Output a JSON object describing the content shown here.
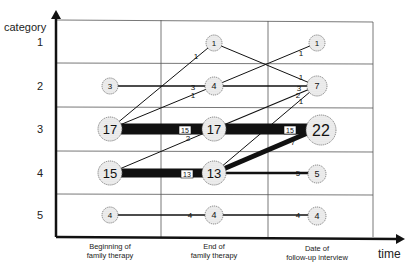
{
  "diagram": {
    "y_axis_label": "category",
    "x_axis_label": "time",
    "categories": [
      "1",
      "2",
      "3",
      "4",
      "5"
    ],
    "time_points": [
      {
        "label_line1": "Beginning of",
        "label_line2": "family therapy"
      },
      {
        "label_line1": "End of",
        "label_line2": "family therapy"
      },
      {
        "label_line1": "Date of",
        "label_line2": "follow-up interview"
      }
    ],
    "nodes": [
      {
        "time": 0,
        "category": 2,
        "count": 3
      },
      {
        "time": 0,
        "category": 3,
        "count": 17
      },
      {
        "time": 0,
        "category": 4,
        "count": 15
      },
      {
        "time": 0,
        "category": 5,
        "count": 4
      },
      {
        "time": 1,
        "category": 1,
        "count": 1
      },
      {
        "time": 1,
        "category": 2,
        "count": 4
      },
      {
        "time": 1,
        "category": 3,
        "count": 17
      },
      {
        "time": 1,
        "category": 4,
        "count": 13
      },
      {
        "time": 1,
        "category": 5,
        "count": 4
      },
      {
        "time": 2,
        "category": 1,
        "count": 1
      },
      {
        "time": 2,
        "category": 2,
        "count": 7
      },
      {
        "time": 2,
        "category": 3,
        "count": 22
      },
      {
        "time": 2,
        "category": 4,
        "count": 5
      },
      {
        "time": 2,
        "category": 5,
        "count": 4
      }
    ],
    "flows": [
      {
        "from_time": 0,
        "from_cat": 3,
        "to_cat": 1,
        "count": 1
      },
      {
        "from_time": 0,
        "from_cat": 3,
        "to_cat": 2,
        "count": 1
      },
      {
        "from_time": 0,
        "from_cat": 2,
        "to_cat": 2,
        "count": 3
      },
      {
        "from_time": 0,
        "from_cat": 3,
        "to_cat": 3,
        "count": 15
      },
      {
        "from_time": 0,
        "from_cat": 4,
        "to_cat": 3,
        "count": 2
      },
      {
        "from_time": 0,
        "from_cat": 4,
        "to_cat": 4,
        "count": 13
      },
      {
        "from_time": 0,
        "from_cat": 5,
        "to_cat": 5,
        "count": 4
      },
      {
        "from_time": 1,
        "from_cat": 1,
        "to_cat": 2,
        "count": 1
      },
      {
        "from_time": 1,
        "from_cat": 2,
        "to_cat": 1,
        "count": 1
      },
      {
        "from_time": 1,
        "from_cat": 2,
        "to_cat": 2,
        "count": 3
      },
      {
        "from_time": 1,
        "from_cat": 3,
        "to_cat": 2,
        "count": 2
      },
      {
        "from_time": 1,
        "from_cat": 3,
        "to_cat": 3,
        "count": 15
      },
      {
        "from_time": 1,
        "from_cat": 4,
        "to_cat": 2,
        "count": 1
      },
      {
        "from_time": 1,
        "from_cat": 4,
        "to_cat": 3,
        "count": 7
      },
      {
        "from_time": 1,
        "from_cat": 4,
        "to_cat": 4,
        "count": 5
      },
      {
        "from_time": 1,
        "from_cat": 5,
        "to_cat": 5,
        "count": 4
      }
    ]
  }
}
